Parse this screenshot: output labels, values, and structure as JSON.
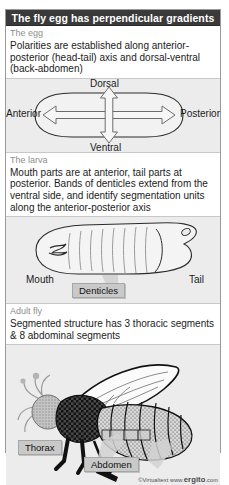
{
  "figure": {
    "title": "The fly egg has perpendicular gradients",
    "credit_prefix": "©Virtualtext  www.",
    "credit_brand": "ergito",
    "credit_suffix": ".com"
  },
  "sections": [
    {
      "id": "egg",
      "heading": "The egg",
      "body": "Polarities are established along anterior-posterior (head-tail) axis and dorsal-ventral (back-abdomen)",
      "labels": {
        "dorsal": "Dorsal",
        "ventral": "Ventral",
        "anterior": "Anterior",
        "posterior": "Posterior"
      }
    },
    {
      "id": "larva",
      "heading": "The larva",
      "body": "Mouth parts are at anterior, tail parts at posterior. Bands of denticles extend from the ventral side, and identify segmentation units along the anterior-posterior axis",
      "labels": {
        "mouth": "Mouth",
        "tail": "Tail",
        "denticles": "Denticles"
      }
    },
    {
      "id": "adult",
      "heading": "Adult fly",
      "body": "Segmented structure has 3 thoracic segments & 8 abdominal segments",
      "labels": {
        "thorax": "Thorax",
        "abdomen": "Abdomen"
      }
    }
  ],
  "colors": {
    "title_bar": "#3a3a3a",
    "panel_bg": "#ececec",
    "chip": "#c9c9c9",
    "heading_text": "#8e8e8e",
    "body_text": "#1b1b1b"
  }
}
